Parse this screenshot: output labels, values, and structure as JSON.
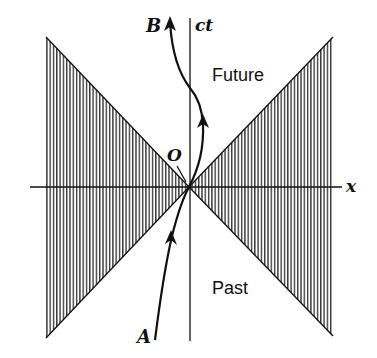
{
  "diagram": {
    "type": "spacetime-light-cone",
    "axes": {
      "x_label": "x",
      "ct_label": "ct"
    },
    "regions": {
      "future_label": "Future",
      "past_label": "Past"
    },
    "points": {
      "origin_label": "O",
      "start_label": "A",
      "end_label": "B"
    },
    "colors": {
      "ink": "#111111",
      "hatch": "#333333",
      "background": "#ffffff"
    }
  }
}
